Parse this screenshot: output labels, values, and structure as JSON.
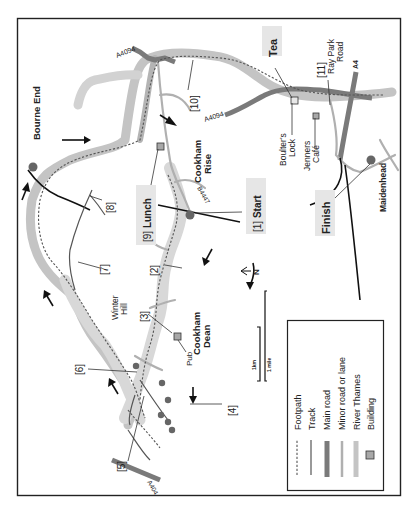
{
  "map": {
    "orientation": "rotated 90 degrees counter-clockwise (north points left)",
    "north_label": "N",
    "scale": {
      "km_label": "1km",
      "mile_label": "1 mile"
    },
    "places": {
      "bourne_end": "Bourne End",
      "cookham_rise": "Cookham Rise",
      "cookham_rise_line1": "Cookham",
      "cookham_rise_line2": "Rise",
      "cookham_dean_line1": "Cookham",
      "cookham_dean_line2": "Dean",
      "winter_hill_line1": "Winter",
      "winter_hill_line2": "Hill",
      "maidenhead": "Maidenhead",
      "boulters_lock_line1": "Boulter's",
      "boulters_lock_line2": "Lock",
      "jenners_cafe_line1": "Jenners",
      "jenners_cafe_line2": "Café",
      "ray_park_road_line1": "Ray Park",
      "ray_park_road_line2": "Road",
      "pub": "Pub"
    },
    "roads": {
      "a4094_west": "A4094",
      "a4094_east": "A4094",
      "b4447": "B4447",
      "a4": "A4",
      "a404": "A404"
    },
    "waypoints": [
      {
        "num": "[1]",
        "label": "Start"
      },
      {
        "num": "[2]",
        "label": ""
      },
      {
        "num": "[3]",
        "label": ""
      },
      {
        "num": "[4]",
        "label": ""
      },
      {
        "num": "[5]",
        "label": ""
      },
      {
        "num": "[6]",
        "label": ""
      },
      {
        "num": "[7]",
        "label": ""
      },
      {
        "num": "[8]",
        "label": ""
      },
      {
        "num": "[9]",
        "label": "Lunch"
      },
      {
        "num": "[10]",
        "label": ""
      },
      {
        "num": "[11]",
        "label": ""
      }
    ],
    "callouts": {
      "tea": "Tea",
      "finish": "Finish"
    },
    "legend": {
      "items": [
        {
          "label": "Footpath",
          "style": "dotted",
          "color": "#555555"
        },
        {
          "label": "Track",
          "style": "thin-line",
          "color": "#555555"
        },
        {
          "label": "Main road",
          "style": "thick-line",
          "color": "#7a7a7a"
        },
        {
          "label": "Minor road or lane",
          "style": "medium-line",
          "color": "#b0b0b0"
        },
        {
          "label": "River Thames",
          "style": "wide-band",
          "color": "#c4c4c4"
        },
        {
          "label": "Building",
          "style": "square",
          "color": "#a8a8a8"
        }
      ]
    },
    "colors": {
      "river": "#c4c4c4",
      "main_road": "#7a7a7a",
      "minor_road": "#b0b0b0",
      "footpath": "#555555",
      "town_dot": "#666666",
      "label_highlight": "#e6e6e6"
    }
  }
}
